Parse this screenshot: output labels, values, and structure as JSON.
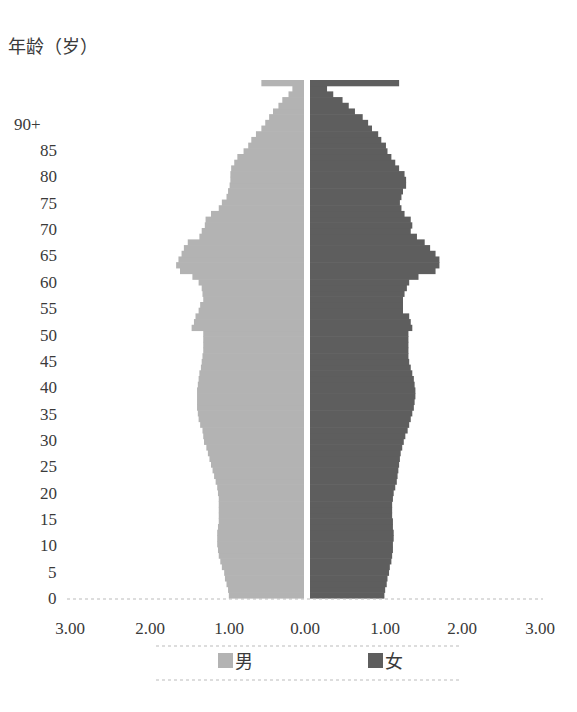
{
  "chart_data": {
    "type": "bar",
    "orientation": "horizontal",
    "subtype": "population-pyramid",
    "title": "",
    "ylabel": "年龄（岁）",
    "xlabel": "",
    "y_tick_labels": [
      "0",
      "5",
      "10",
      "15",
      "20",
      "25",
      "30",
      "35",
      "40",
      "45",
      "50",
      "55",
      "60",
      "65",
      "70",
      "75",
      "80",
      "85",
      "90+"
    ],
    "x_tick_labels": [
      "3.00",
      "2.00",
      "1.00",
      "0.00",
      "1.00",
      "2.00",
      "3.00"
    ],
    "xlim": [
      -3,
      3
    ],
    "grid": false,
    "legend_position": "bottom",
    "categories": [
      "0",
      "1",
      "2",
      "3",
      "4",
      "5",
      "6",
      "7",
      "8",
      "9",
      "10",
      "11",
      "12",
      "13",
      "14",
      "15",
      "16",
      "17",
      "18",
      "19",
      "20",
      "21",
      "22",
      "23",
      "24",
      "25",
      "26",
      "27",
      "28",
      "29",
      "30",
      "31",
      "32",
      "33",
      "34",
      "35",
      "36",
      "37",
      "38",
      "39",
      "40",
      "41",
      "42",
      "43",
      "44",
      "45",
      "46",
      "47",
      "48",
      "49",
      "50",
      "51",
      "52",
      "53",
      "54",
      "55",
      "56",
      "57",
      "58",
      "59",
      "60",
      "61",
      "62",
      "63",
      "64",
      "65",
      "66",
      "67",
      "68",
      "69",
      "70",
      "71",
      "72",
      "73",
      "74",
      "75",
      "76",
      "77",
      "78",
      "79",
      "80",
      "81",
      "82",
      "83",
      "84",
      "85",
      "86",
      "87",
      "88",
      "89",
      "90+"
    ],
    "series": [
      {
        "name": "男",
        "color": "#b3b3b3",
        "values": [
          0.97,
          0.98,
          1.0,
          1.02,
          1.03,
          1.06,
          1.08,
          1.1,
          1.11,
          1.12,
          1.12,
          1.12,
          1.11,
          1.1,
          1.1,
          1.1,
          1.1,
          1.1,
          1.11,
          1.12,
          1.14,
          1.16,
          1.18,
          1.2,
          1.22,
          1.24,
          1.26,
          1.29,
          1.3,
          1.31,
          1.34,
          1.36,
          1.37,
          1.38,
          1.38,
          1.38,
          1.38,
          1.37,
          1.36,
          1.35,
          1.33,
          1.32,
          1.31,
          1.3,
          1.3,
          1.3,
          1.3,
          1.45,
          1.42,
          1.4,
          1.36,
          1.34,
          1.3,
          1.31,
          1.32,
          1.36,
          1.44,
          1.6,
          1.65,
          1.62,
          1.58,
          1.55,
          1.5,
          1.35,
          1.32,
          1.28,
          1.27,
          1.2,
          1.1,
          1.06,
          1.0,
          0.98,
          0.96,
          0.95,
          0.95,
          0.94,
          0.9,
          0.86,
          0.78,
          0.72,
          0.68,
          0.62,
          0.55,
          0.5,
          0.45,
          0.4,
          0.33,
          0.28,
          0.2,
          0.15,
          0.55
        ]
      },
      {
        "name": "女",
        "color": "#5e5e5e",
        "values": [
          0.96,
          0.97,
          0.99,
          1.0,
          1.02,
          1.03,
          1.05,
          1.06,
          1.07,
          1.07,
          1.08,
          1.08,
          1.07,
          1.07,
          1.06,
          1.06,
          1.06,
          1.07,
          1.08,
          1.1,
          1.12,
          1.13,
          1.14,
          1.15,
          1.16,
          1.17,
          1.19,
          1.21,
          1.23,
          1.26,
          1.28,
          1.3,
          1.32,
          1.34,
          1.35,
          1.36,
          1.36,
          1.35,
          1.34,
          1.32,
          1.3,
          1.28,
          1.27,
          1.27,
          1.27,
          1.27,
          1.27,
          1.32,
          1.3,
          1.28,
          1.2,
          1.2,
          1.2,
          1.22,
          1.25,
          1.28,
          1.4,
          1.62,
          1.67,
          1.67,
          1.62,
          1.55,
          1.48,
          1.38,
          1.3,
          1.32,
          1.3,
          1.22,
          1.18,
          1.16,
          1.18,
          1.2,
          1.24,
          1.24,
          1.22,
          1.15,
          1.1,
          1.05,
          1.0,
          0.98,
          0.92,
          0.88,
          0.8,
          0.75,
          0.68,
          0.58,
          0.5,
          0.42,
          0.3,
          0.22,
          1.15
        ]
      }
    ]
  },
  "legend": {
    "items": [
      {
        "label": "男",
        "color": "#b3b3b3"
      },
      {
        "label": "女",
        "color": "#5e5e5e"
      }
    ]
  },
  "axis": {
    "y_title": "年龄（岁）"
  }
}
